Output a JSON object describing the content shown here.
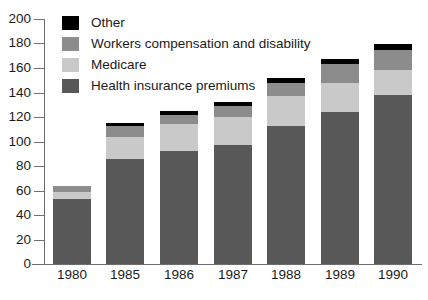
{
  "chart_data": {
    "type": "bar",
    "stacked": true,
    "title": "",
    "subtitle": "",
    "xlabel": "",
    "ylabel": "",
    "categories": [
      "1980",
      "1985",
      "1986",
      "1987",
      "1988",
      "1989",
      "1990"
    ],
    "ylim": [
      0,
      200
    ],
    "yticks": [
      0,
      20,
      40,
      60,
      80,
      100,
      120,
      140,
      160,
      180,
      200
    ],
    "grid": false,
    "legend_position": "top-left",
    "series": [
      {
        "name": "Health insurance premiums",
        "color": "#585858",
        "values": [
          53,
          86,
          92,
          97,
          113,
          124,
          138
        ]
      },
      {
        "name": "Medicare",
        "color": "#c9c9c9",
        "values": [
          6,
          18,
          22,
          23,
          24,
          24,
          20
        ]
      },
      {
        "name": "Workers compensation and disability",
        "color": "#8c8c8c",
        "values": [
          5,
          9,
          8,
          9,
          11,
          15,
          17
        ]
      },
      {
        "name": "Other",
        "color": "#000000",
        "values": [
          0,
          2,
          3,
          3,
          4,
          4,
          5
        ]
      }
    ],
    "totals": [
      64,
      115,
      125,
      132,
      152,
      167,
      180
    ]
  },
  "legend": {
    "items": [
      {
        "label": "Other",
        "color": "#000000",
        "swatch_name": "legend-swatch-other"
      },
      {
        "label": "Workers compensation and disability",
        "color": "#8c8c8c",
        "swatch_name": "legend-swatch-workers"
      },
      {
        "label": "Medicare",
        "color": "#c9c9c9",
        "swatch_name": "legend-swatch-medicare"
      },
      {
        "label": "Health insurance premiums",
        "color": "#585858",
        "swatch_name": "legend-swatch-health"
      }
    ]
  },
  "axes": {
    "y_tick_labels": [
      "200",
      "180",
      "160",
      "140",
      "120",
      "100",
      "80",
      "60",
      "40",
      "20",
      "0"
    ],
    "x_tick_labels": [
      "1980",
      "1985",
      "1986",
      "1987",
      "1988",
      "1989",
      "1990"
    ]
  },
  "colors": {
    "axis": "#6d6d6d",
    "text": "#1a1a1a",
    "background": "#ffffff"
  }
}
